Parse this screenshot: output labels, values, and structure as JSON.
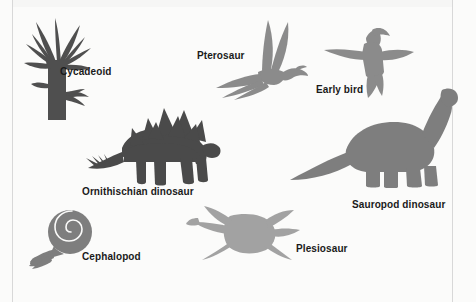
{
  "figure": {
    "type": "labeled-silhouette-diagram",
    "background_color": "#fbfbfa",
    "label_color": "#1a1a1a",
    "dark_silhouette_color": "#545454",
    "light_silhouette_color": "#9a9a9a",
    "medium_silhouette_color": "#8b8b8b",
    "border_color": "#d8d8d8"
  },
  "organisms": [
    {
      "id": "cycadeoid",
      "label": "Cycadeoid",
      "icon": "cycadeoid-icon",
      "tone": "dark",
      "label_x": 60,
      "label_y": 66,
      "font_size": 10
    },
    {
      "id": "pterosaur",
      "label": "Pterosaur",
      "icon": "pterosaur-icon",
      "tone": "medium",
      "label_x": 197,
      "label_y": 50,
      "font_size": 10
    },
    {
      "id": "early-bird",
      "label": "Early bird",
      "icon": "early-bird-icon",
      "tone": "medium",
      "label_x": 316,
      "label_y": 84,
      "font_size": 10
    },
    {
      "id": "ornithischian-dinosaur",
      "label": "Ornithischian dinosaur",
      "icon": "stegosaur-icon",
      "tone": "dark",
      "label_x": 82,
      "label_y": 186,
      "font_size": 10
    },
    {
      "id": "sauropod-dinosaur",
      "label": "Sauropod dinosaur",
      "icon": "sauropod-icon",
      "tone": "medium",
      "label_x": 352,
      "label_y": 199,
      "font_size": 10
    },
    {
      "id": "cephalopod",
      "label": "Cephalopod",
      "icon": "ammonite-icon",
      "tone": "medium",
      "label_x": 82,
      "label_y": 251,
      "font_size": 10
    },
    {
      "id": "plesiosaur",
      "label": "Plesiosaur",
      "icon": "plesiosaur-icon",
      "tone": "light",
      "label_x": 296,
      "label_y": 243,
      "font_size": 10
    }
  ]
}
